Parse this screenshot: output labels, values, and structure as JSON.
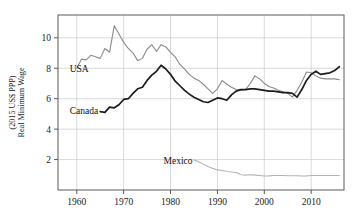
{
  "chart_data": {
    "type": "line",
    "title": "",
    "xlabel": "",
    "ylabel": "Real Minimum Wage\n(2015 US$ PPP)",
    "ylabel_line1": "Real Minimum Wage",
    "ylabel_line2": "(2015 US$ PPP)",
    "xlim": [
      1956,
      2017
    ],
    "ylim": [
      0.0,
      11.5
    ],
    "grid": true,
    "legend": "inline-annotations",
    "xticks": [
      1960,
      1970,
      1980,
      1990,
      2000,
      2010
    ],
    "xtick_labels": [
      "1960",
      "1970",
      "1980",
      "1990",
      "2000",
      "2010"
    ],
    "yticks": [
      2,
      4,
      6,
      8,
      10
    ],
    "ytick_labels": [
      "2",
      "4",
      "6",
      "8",
      "10"
    ],
    "annotations": [
      {
        "text": "USA",
        "x": 1958.5,
        "y": 7.75
      },
      {
        "text": "Canada",
        "x": 1958.5,
        "y": 5.0
      },
      {
        "text": "Mexico",
        "x": 1978.5,
        "y": 1.72
      }
    ],
    "series": [
      {
        "name": "USA",
        "color": "#8a8a8a",
        "width": 1.1,
        "x": [
          1960,
          1961,
          1962,
          1963,
          1964,
          1965,
          1966,
          1967,
          1968,
          1969,
          1970,
          1971,
          1972,
          1973,
          1974,
          1975,
          1976,
          1977,
          1978,
          1979,
          1980,
          1981,
          1982,
          1983,
          1984,
          1985,
          1986,
          1987,
          1988,
          1989,
          1990,
          1991,
          1992,
          1993,
          1994,
          1995,
          1996,
          1997,
          1998,
          1999,
          2000,
          2001,
          2002,
          2003,
          2004,
          2005,
          2006,
          2007,
          2008,
          2009,
          2010,
          2011,
          2012,
          2013,
          2014,
          2015,
          2016
        ],
        "values": [
          8.0,
          8.6,
          8.55,
          8.85,
          8.75,
          8.65,
          9.3,
          9.05,
          10.8,
          10.25,
          9.7,
          9.3,
          9.0,
          8.5,
          8.65,
          9.25,
          9.55,
          9.1,
          9.55,
          9.4,
          9.05,
          8.75,
          8.25,
          7.95,
          7.6,
          7.35,
          7.2,
          6.95,
          6.65,
          6.35,
          6.65,
          7.2,
          6.95,
          6.75,
          6.6,
          6.55,
          6.6,
          7.0,
          7.5,
          7.3,
          7.0,
          6.8,
          6.7,
          6.55,
          6.45,
          6.35,
          6.1,
          6.55,
          7.1,
          7.75,
          7.7,
          7.5,
          7.35,
          7.3,
          7.3,
          7.3,
          7.25
        ]
      },
      {
        "name": "Canada",
        "color": "#1c1c1c",
        "width": 1.7,
        "x": [
          1965,
          1966,
          1967,
          1968,
          1969,
          1970,
          1971,
          1972,
          1973,
          1974,
          1975,
          1976,
          1977,
          1978,
          1979,
          1980,
          1981,
          1982,
          1983,
          1984,
          1985,
          1986,
          1987,
          1988,
          1989,
          1990,
          1991,
          1992,
          1993,
          1994,
          1995,
          1996,
          1997,
          1998,
          1999,
          2000,
          2001,
          2002,
          2003,
          2004,
          2005,
          2006,
          2007,
          2008,
          2009,
          2010,
          2011,
          2012,
          2013,
          2014,
          2015,
          2016
        ],
        "values": [
          5.15,
          5.1,
          5.45,
          5.4,
          5.6,
          5.95,
          6.0,
          6.35,
          6.65,
          6.75,
          7.2,
          7.55,
          7.8,
          8.2,
          7.95,
          7.6,
          7.15,
          6.85,
          6.55,
          6.3,
          6.1,
          5.95,
          5.8,
          5.75,
          5.9,
          6.05,
          6.0,
          5.9,
          6.25,
          6.5,
          6.6,
          6.6,
          6.65,
          6.65,
          6.6,
          6.55,
          6.5,
          6.5,
          6.45,
          6.4,
          6.4,
          6.35,
          6.1,
          6.6,
          7.2,
          7.6,
          7.8,
          7.6,
          7.65,
          7.7,
          7.85,
          8.1
        ]
      },
      {
        "name": "Mexico",
        "color": "#b4b4b4",
        "width": 1.1,
        "x": [
          1985,
          1986,
          1987,
          1988,
          1989,
          1990,
          1991,
          1992,
          1993,
          1994,
          1995,
          1996,
          1997,
          1998,
          1999,
          2000,
          2001,
          2002,
          2003,
          2004,
          2005,
          2006,
          2007,
          2008,
          2009,
          2010,
          2011,
          2012,
          2013,
          2014,
          2015,
          2016
        ],
        "values": [
          1.98,
          1.85,
          1.7,
          1.55,
          1.42,
          1.32,
          1.28,
          1.22,
          1.18,
          1.15,
          1.0,
          0.98,
          1.0,
          0.98,
          0.95,
          0.92,
          0.93,
          0.95,
          0.95,
          0.95,
          0.94,
          0.94,
          0.94,
          0.92,
          0.93,
          0.95,
          0.95,
          0.95,
          0.95,
          0.95,
          0.95,
          0.95
        ]
      }
    ]
  },
  "layout": {
    "plot_left": 58,
    "plot_right": 344,
    "plot_top": 15,
    "plot_bottom": 190
  }
}
